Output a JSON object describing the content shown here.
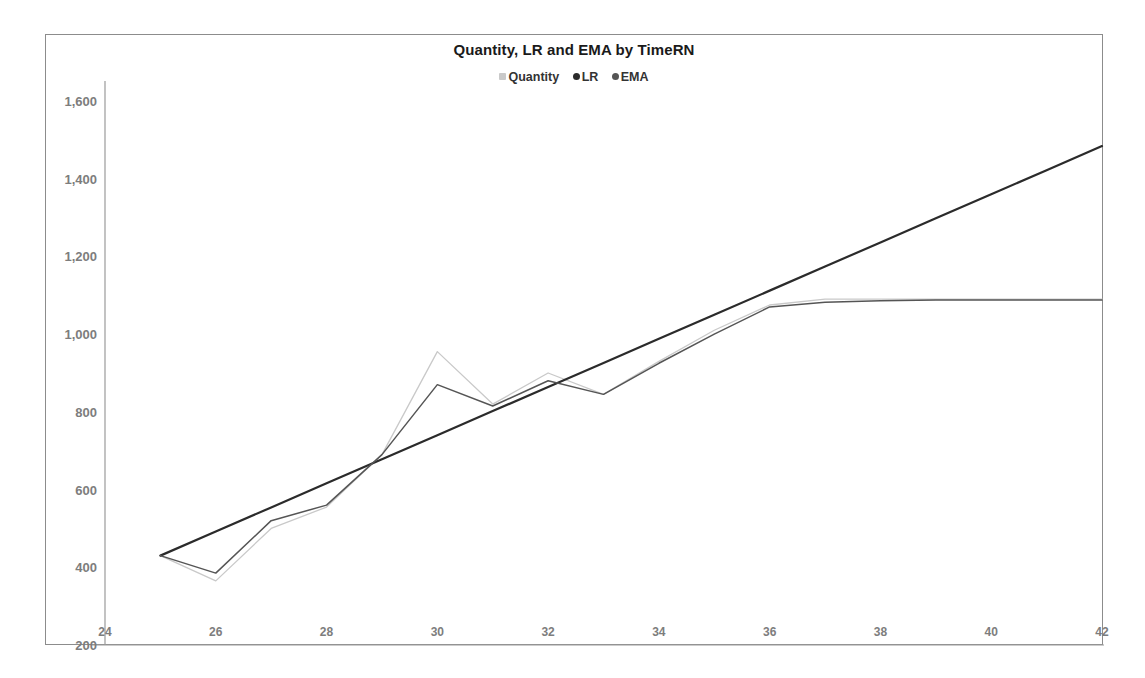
{
  "chart_data": {
    "type": "line",
    "title": "Quantity, LR and EMA by TimeRN",
    "xlabel": "",
    "ylabel": "",
    "xlim": [
      24,
      42
    ],
    "ylim": [
      200,
      1600
    ],
    "xticks": [
      24,
      26,
      28,
      30,
      32,
      34,
      36,
      38,
      40,
      42
    ],
    "yticks": [
      200,
      400,
      600,
      800,
      1000,
      1200,
      1400,
      1600
    ],
    "ytick_labels": [
      "200",
      "400",
      "600",
      "800",
      "1,000",
      "1,200",
      "1,400",
      "1,600"
    ],
    "xtick_labels": [
      "24",
      "26",
      "28",
      "30",
      "32",
      "34",
      "36",
      "38",
      "40",
      "42"
    ],
    "grid": false,
    "legend_position": "top-center",
    "legend": [
      {
        "name": "Quantity",
        "color": "#c9c9c9",
        "marker": "square"
      },
      {
        "name": "LR",
        "color": "#2b2b2b",
        "marker": "circle"
      },
      {
        "name": "EMA",
        "color": "#555555",
        "marker": "circle"
      }
    ],
    "x": [
      25,
      26,
      27,
      28,
      29,
      30,
      31,
      32,
      33,
      34,
      35,
      36,
      37,
      38,
      39,
      40,
      41,
      42
    ],
    "series": [
      {
        "name": "Quantity",
        "color": "#c9c9c9",
        "values": [
          430,
          365,
          500,
          555,
          690,
          955,
          820,
          900,
          845,
          930,
          1010,
          1075,
          1090,
          1090,
          1090,
          1090,
          1090,
          1090
        ]
      },
      {
        "name": "LR",
        "color": "#2b2b2b",
        "values": [
          430,
          492,
          554,
          616,
          678,
          740,
          802,
          864,
          926,
          988,
          1050,
          1112,
          1174,
          1236,
          1298,
          1360,
          1422,
          1484
        ]
      },
      {
        "name": "EMA",
        "color": "#555555",
        "values": [
          430,
          385,
          520,
          560,
          690,
          870,
          815,
          880,
          845,
          925,
          1000,
          1070,
          1082,
          1086,
          1088,
          1088,
          1088,
          1088
        ]
      }
    ]
  }
}
